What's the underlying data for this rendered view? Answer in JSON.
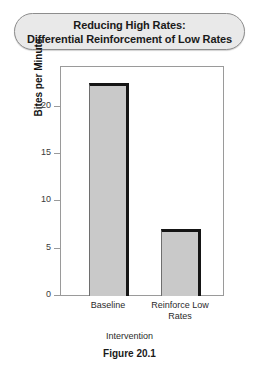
{
  "figure": {
    "title_line1": "Reducing High Rates:",
    "title_line2": "Differential Reinforcement of Low Rates",
    "caption": "Figure 20.1"
  },
  "chart_data": {
    "type": "bar",
    "title": "Reducing High Rates: Differential Reinforcement of Low Rates",
    "categories": [
      "Baseline",
      "Reinforce Low Rates"
    ],
    "category_lines": [
      [
        "Baseline"
      ],
      [
        "Reinforce Low",
        "Rates"
      ]
    ],
    "values": [
      22.6,
      7.2
    ],
    "xlabel": "Intervention",
    "ylabel": "Bites per Minute",
    "ylim": [
      0,
      24.3
    ],
    "yticks": [
      0,
      5,
      10,
      15,
      20
    ],
    "ytick_labels": [
      "0",
      "5",
      "10",
      "15",
      "20"
    ],
    "grid": false,
    "legend": false,
    "bar_fill_color": "#c9c9c9",
    "bar_edge_color": "#151515",
    "frame_color": "#9a9a9a",
    "title_pill_fill": "#e9e9e9",
    "title_pill_border": "#8d8d8d"
  }
}
